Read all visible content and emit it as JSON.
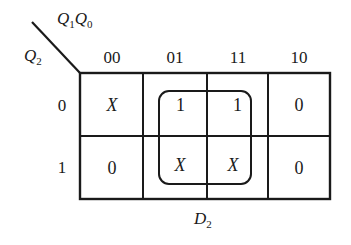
{
  "kmap": {
    "title": "D",
    "title_sub": "2",
    "col_var": {
      "a": "Q",
      "a_sub": "1",
      "b": "Q",
      "b_sub": "0"
    },
    "row_var": {
      "a": "Q",
      "a_sub": "2"
    },
    "col_headers": [
      "00",
      "01",
      "11",
      "10"
    ],
    "row_headers": [
      "0",
      "1"
    ],
    "cells": [
      [
        "X",
        "1",
        "1",
        "0"
      ],
      [
        "0",
        "X",
        "X",
        "0"
      ]
    ],
    "groups": [
      {
        "rows": [
          0,
          1
        ],
        "cols": [
          1,
          2
        ],
        "term": "Q0"
      }
    ]
  }
}
